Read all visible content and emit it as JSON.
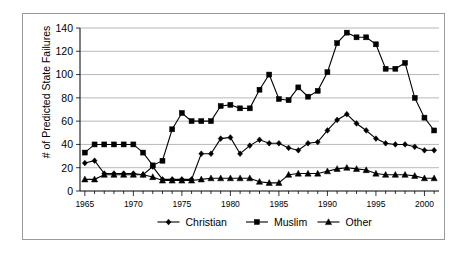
{
  "chart_data": {
    "type": "line",
    "title": "",
    "xlabel": "",
    "ylabel": "# of Predicted State Failures",
    "xlim": [
      1964.5,
      2001.5
    ],
    "ylim": [
      0,
      140
    ],
    "yticks": [
      0,
      20,
      40,
      60,
      80,
      100,
      120,
      140
    ],
    "ytick_labels": [
      "0",
      "20",
      "40",
      "60",
      "80",
      "100",
      "120",
      "140"
    ],
    "xticks": [
      1965,
      1970,
      1975,
      1980,
      1985,
      1990,
      1995,
      2000
    ],
    "xtick_labels": [
      "1965",
      "1970",
      "1975",
      "1980",
      "1985",
      "1990",
      "1995",
      "2000"
    ],
    "x": [
      1965,
      1966,
      1967,
      1968,
      1969,
      1970,
      1971,
      1972,
      1973,
      1974,
      1975,
      1976,
      1977,
      1978,
      1979,
      1980,
      1981,
      1982,
      1983,
      1984,
      1985,
      1986,
      1987,
      1988,
      1989,
      1990,
      1991,
      1992,
      1993,
      1994,
      1995,
      1996,
      1997,
      1998,
      1999,
      2000,
      2001
    ],
    "grid": true,
    "legend_position": "bottom",
    "series": [
      {
        "name": "Christian",
        "marker": "diamond",
        "values": [
          24,
          26,
          15,
          15,
          15,
          15,
          14,
          21,
          10,
          10,
          10,
          10,
          32,
          32,
          45,
          46,
          32,
          39,
          44,
          41,
          41,
          37,
          35,
          41,
          42,
          52,
          61,
          66,
          58,
          52,
          45,
          41,
          40,
          40,
          38,
          35,
          35
        ]
      },
      {
        "name": "Muslim",
        "marker": "square",
        "values": [
          33,
          40,
          40,
          40,
          40,
          40,
          33,
          22,
          26,
          53,
          67,
          60,
          60,
          60,
          73,
          74,
          71,
          71,
          87,
          100,
          79,
          78,
          89,
          81,
          86,
          102,
          127,
          136,
          132,
          132,
          126,
          105,
          105,
          110,
          80,
          63,
          52
        ]
      },
      {
        "name": "Other",
        "marker": "triangle",
        "values": [
          10,
          10,
          14,
          14,
          14,
          14,
          14,
          12,
          9,
          9,
          9,
          9,
          10,
          11,
          11,
          11,
          11,
          11,
          8,
          7,
          7,
          14,
          15,
          15,
          15,
          17,
          19,
          20,
          19,
          18,
          15,
          14,
          14,
          14,
          13,
          11,
          11
        ]
      }
    ]
  },
  "legend": {
    "items": [
      {
        "label": "Christian",
        "marker": "diamond"
      },
      {
        "label": "Muslim",
        "marker": "square"
      },
      {
        "label": "Other",
        "marker": "triangle"
      }
    ]
  },
  "colors": {
    "series": "#000000",
    "grid": "#9a9a9a",
    "frame": "#9a9a9a",
    "background": "#ffffff"
  }
}
